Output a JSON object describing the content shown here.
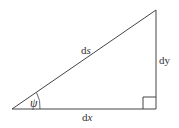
{
  "diagram": {
    "type": "right-triangle",
    "labels": {
      "hypotenuse": {
        "prefix": "d",
        "var": "s"
      },
      "vertical": {
        "prefix": "d",
        "var": "y"
      },
      "horizontal": {
        "prefix": "d",
        "var": "x"
      },
      "angle": "ψ"
    },
    "stroke_color": "#444444"
  }
}
